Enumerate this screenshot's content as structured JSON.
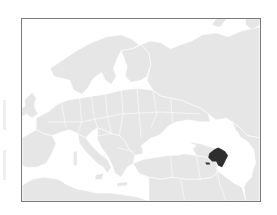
{
  "map": {
    "type": "locator-map",
    "region_shown": "Europe and Western Asia",
    "highlighted_country": "Azerbaijan",
    "colors": {
      "land": "#e6e6e6",
      "borders": "#ffffff",
      "water": "#ffffff",
      "highlight": "#2e2e2e",
      "frame": "#7a7a7a"
    },
    "label": "Azerbaijan"
  }
}
